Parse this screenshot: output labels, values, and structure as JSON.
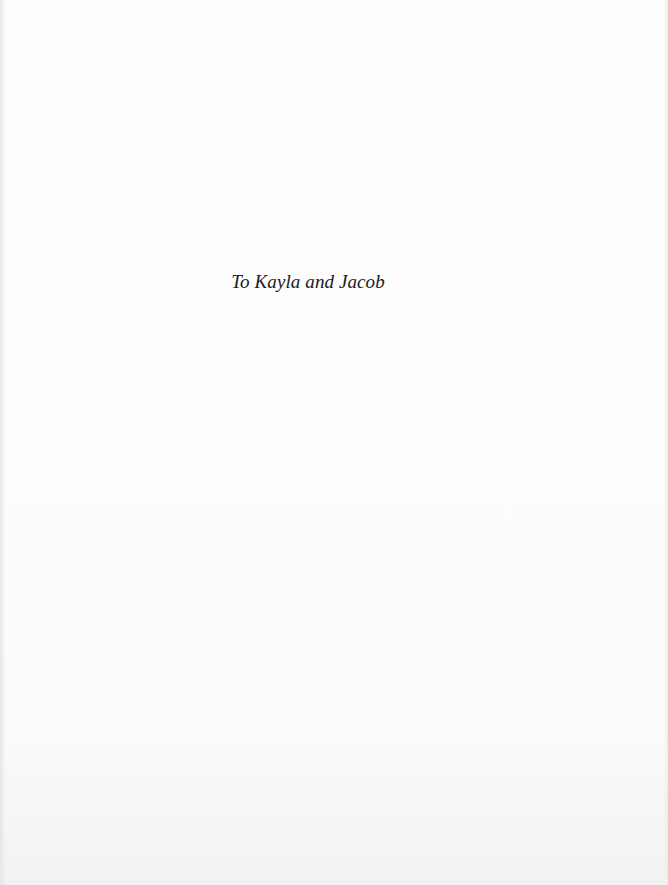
{
  "page": {
    "type": "dedication",
    "dedication_text": "To Kayla and Jacob"
  }
}
